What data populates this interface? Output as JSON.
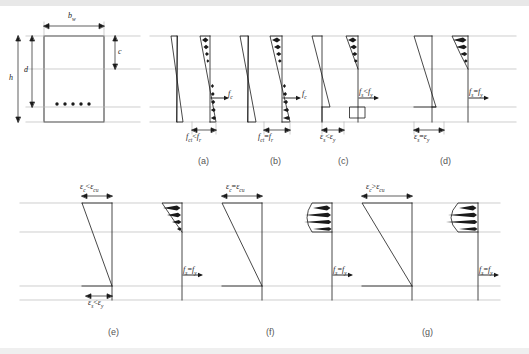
{
  "figure": {
    "title_caption": "",
    "section_labels": {
      "width": "b",
      "width_sub": "w",
      "height": "h",
      "effective_depth": "d",
      "neutral_axis_depth": "c"
    },
    "panels": [
      {
        "id": "a",
        "caption": "(a)",
        "stress_label": "f",
        "stress_label_sub": "c",
        "bottom_label_left": "f",
        "bottom_label_left_sub": "ct",
        "bottom_label_op": "<",
        "bottom_label_right": "f",
        "bottom_label_right_sub": "r"
      },
      {
        "id": "b",
        "caption": "(b)",
        "stress_label": "f",
        "stress_label_sub": "c",
        "bottom_label_left": "f",
        "bottom_label_left_sub": "ct",
        "bottom_label_op": "=",
        "bottom_label_right": "f",
        "bottom_label_right_sub": "r"
      },
      {
        "id": "c",
        "caption": "(c)",
        "stress_label_left": "f",
        "stress_label_left_sub": "s",
        "stress_label_op": "<",
        "stress_label_right": "f",
        "stress_label_right_sub": "y",
        "bottom_label_left": "ε",
        "bottom_label_left_sub": "s",
        "bottom_label_op": "<",
        "bottom_label_right": "ε",
        "bottom_label_right_sub": "y"
      },
      {
        "id": "d",
        "caption": "(d)",
        "stress_label_left": "f",
        "stress_label_left_sub": "s",
        "stress_label_op": "=",
        "stress_label_right": "f",
        "stress_label_right_sub": "y",
        "bottom_label_left": "ε",
        "bottom_label_left_sub": "s",
        "bottom_label_op": "=",
        "bottom_label_right": "ε",
        "bottom_label_right_sub": "y"
      },
      {
        "id": "e",
        "caption": "(e)",
        "top_label_left": "ε",
        "top_label_left_sub": "c",
        "top_label_op": "<",
        "top_label_right": "ε",
        "top_label_right_sub": "cu",
        "stress_label_left": "f",
        "stress_label_left_sub": "s",
        "stress_label_op": "=",
        "stress_label_right": "f",
        "stress_label_right_sub": "y",
        "bottom_label_left": "ε",
        "bottom_label_left_sub": "s",
        "bottom_label_op": "<",
        "bottom_label_right": "ε",
        "bottom_label_right_sub": "y"
      },
      {
        "id": "f",
        "caption": "(f)",
        "top_label_left": "ε",
        "top_label_left_sub": "c",
        "top_label_op": "=",
        "top_label_right": "ε",
        "top_label_right_sub": "cu",
        "stress_label_left": "f",
        "stress_label_left_sub": "s",
        "stress_label_op": "=",
        "stress_label_right": "f",
        "stress_label_right_sub": "y"
      },
      {
        "id": "g",
        "caption": "(g)",
        "top_label_left": "ε",
        "top_label_left_sub": "c",
        "top_label_op": ">",
        "top_label_right": "ε",
        "top_label_right_sub": "cu",
        "stress_label_left": "f",
        "stress_label_left_sub": "s",
        "stress_label_op": "=",
        "stress_label_right": "f",
        "stress_label_right_sub": "y"
      }
    ],
    "colors": {
      "line": "#1a1a1a",
      "guide": "#b9b9b9",
      "text": "#1a1a1a",
      "caption": "#555555",
      "bar": "#e8e8e8"
    }
  }
}
